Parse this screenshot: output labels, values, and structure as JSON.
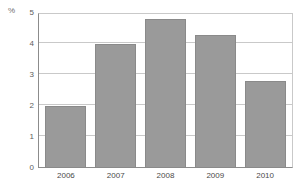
{
  "chart_data": {
    "type": "bar",
    "title": "",
    "xlabel": "",
    "ylabel": "%",
    "categories": [
      "2006",
      "2007",
      "2008",
      "2009",
      "2010"
    ],
    "values": [
      2.0,
      4.0,
      4.8,
      4.3,
      2.8
    ],
    "ylim": [
      0,
      5
    ],
    "yticks": [
      "0",
      "1",
      "2",
      "3",
      "4",
      "5"
    ],
    "ytick_values": [
      0,
      1,
      2,
      3,
      4,
      5
    ],
    "grid": true,
    "legend": null,
    "bar_color": "#9a9a9a",
    "bar_border_color": "#8a8a8a",
    "grid_color": "#c9c9c9",
    "axis_color": "#8c8c8c",
    "background": "#ffffff"
  }
}
